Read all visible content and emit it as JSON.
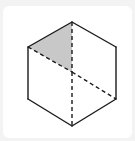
{
  "diagram": {
    "type": "cube-hexagon-projection",
    "colors": {
      "background": "#f3f3f3",
      "panel": "#ffffff",
      "stroke": "#1a1a1a",
      "shade": "#c8c8c8"
    },
    "vertices": {
      "top": [
        72,
        22
      ],
      "upper_left": [
        28,
        47
      ],
      "upper_right": [
        116,
        47
      ],
      "center": [
        72,
        72
      ],
      "lower_left": [
        28,
        99
      ],
      "lower_right": [
        116,
        99
      ],
      "bottom": [
        72,
        126
      ]
    },
    "solid_edges": [
      "top-upper_left",
      "top-upper_right",
      "upper_left-lower_left",
      "upper_right-lower_right",
      "lower_left-bottom",
      "lower_right-bottom"
    ],
    "dashed_edges": [
      "top-center",
      "upper_left-center",
      "center-lower_right",
      "center-bottom"
    ],
    "shaded_region": [
      "top",
      "upper_left",
      "center"
    ]
  }
}
